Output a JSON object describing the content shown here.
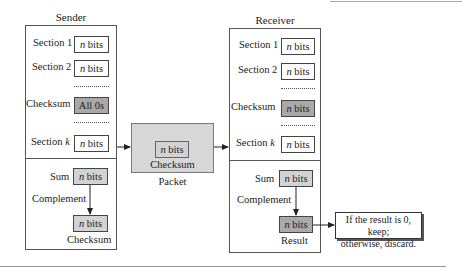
{
  "sender": {
    "title": "Sender",
    "sections": [
      {
        "label": "Section 1",
        "value_var": "n",
        "value_unit": "bits"
      },
      {
        "label": "Section 2",
        "value_var": "n",
        "value_unit": "bits"
      },
      {
        "label": "Checksum",
        "value": "All 0s"
      },
      {
        "label": "Section k_prefix",
        "prefix": "Section",
        "var": "k",
        "value_var": "n",
        "value_unit": "bits"
      }
    ],
    "sum_label": "Sum",
    "complement_label": "Complement",
    "sum_value_var": "n",
    "sum_value_unit": "bits",
    "result_value_var": "n",
    "result_value_unit": "bits",
    "result_caption": "Checksum"
  },
  "packet": {
    "inner_var": "n",
    "inner_unit": "bits",
    "inner_caption": "Checksum",
    "caption": "Packet"
  },
  "receiver": {
    "title": "Receiver",
    "sections": [
      {
        "label": "Section 1",
        "value_var": "n",
        "value_unit": "bits"
      },
      {
        "label": "Section 2",
        "value_var": "n",
        "value_unit": "bits"
      },
      {
        "label": "Checksum",
        "value_var": "n",
        "value_unit": "bits"
      },
      {
        "prefix": "Section",
        "var": "k",
        "value_var": "n",
        "value_unit": "bits"
      }
    ],
    "sum_label": "Sum",
    "complement_label": "Complement",
    "sum_value_var": "n",
    "sum_value_unit": "bits",
    "result_value_var": "n",
    "result_value_unit": "bits",
    "result_caption": "Result"
  },
  "decision": {
    "line1": "If the result is 0, keep;",
    "line2": "otherwise, discard."
  },
  "colors": {
    "light_gray": "#d2d2d2",
    "dark_gray": "#a9a9a9",
    "packet_gray": "#d7d7d7"
  }
}
